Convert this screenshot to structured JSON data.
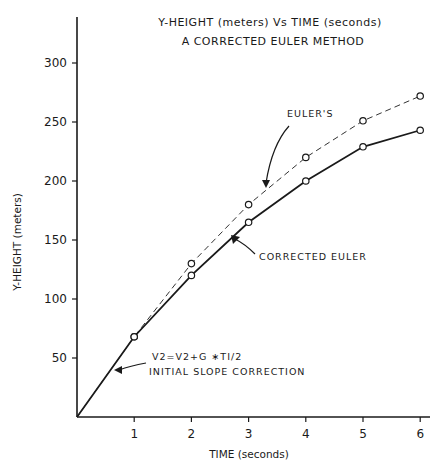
{
  "chart_data": {
    "type": "line",
    "title": "Y-HEIGHT (meters) Vs TIME (seconds)",
    "subtitle": "A CORRECTED EULER METHOD",
    "xlabel": "TIME (seconds)",
    "ylabel": "Y-HEIGHT (meters)",
    "x": [
      0,
      1,
      2,
      3,
      4,
      5,
      6
    ],
    "x_ticks": [
      "1",
      "2",
      "3",
      "4",
      "5",
      "6"
    ],
    "y_ticks": [
      "50",
      "100",
      "150",
      "200",
      "250",
      "300"
    ],
    "xlim": [
      0,
      6
    ],
    "ylim": [
      0,
      330
    ],
    "grid": false,
    "series": [
      {
        "name": "EULER'S",
        "style": "dashed",
        "marker": "open-circle",
        "values": [
          0,
          68,
          130,
          180,
          220,
          251,
          272
        ]
      },
      {
        "name": "CORRECTED EULER",
        "style": "solid",
        "marker": "open-circle",
        "values": [
          0,
          68,
          120,
          165,
          200,
          229,
          243
        ]
      }
    ],
    "annotations": [
      {
        "text": "EULER'S",
        "points_to": "dashed series near t=3.2"
      },
      {
        "text": "CORRECTED EULER",
        "points_to": "solid series near t=2.8"
      },
      {
        "text_line1": "V2=V2+G ∗TI/2",
        "text_line2": "INITIAL SLOPE CORRECTION",
        "points_to": "solid series near t=0.55"
      }
    ]
  },
  "labels": {
    "title": "Y-HEIGHT (meters) Vs TIME (seconds)",
    "subtitle": "A CORRECTED EULER METHOD",
    "xlabel": "TIME (seconds)",
    "ylabel": "Y-HEIGHT (meters)",
    "euler_label": "EULER'S",
    "corrected_label": "CORRECTED EULER",
    "slope_eq": "V2=V2+G ∗TI/2",
    "slope_note": "INITIAL SLOPE CORRECTION"
  }
}
